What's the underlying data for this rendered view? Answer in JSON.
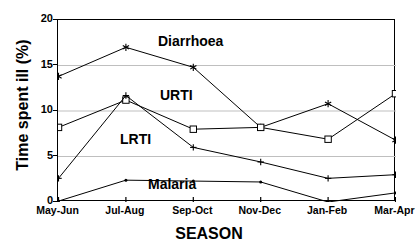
{
  "chart_data": {
    "type": "line",
    "title": "",
    "xlabel": "SEASON",
    "ylabel": "Time spent ill (%)",
    "categories": [
      "May-Jun",
      "Jul-Aug",
      "Sep-Oct",
      "Nov-Dec",
      "Jan-Feb",
      "Mar-Apr"
    ],
    "ylim": [
      0,
      20
    ],
    "yticks": [
      0,
      5,
      10,
      15,
      20
    ],
    "grid": "horizontal",
    "legend_position": "inline-annotations",
    "series": [
      {
        "name": "Diarrhoea",
        "marker": "star",
        "color": "#000000",
        "values": [
          13.8,
          17.0,
          14.8,
          8.2,
          10.8,
          6.8
        ]
      },
      {
        "name": "URTI",
        "marker": "open-square",
        "color": "#000000",
        "values": [
          8.2,
          11.2,
          8.0,
          8.2,
          6.9,
          11.9
        ]
      },
      {
        "name": "LRTI",
        "marker": "plus",
        "color": "#000000",
        "values": [
          2.6,
          11.7,
          6.0,
          4.4,
          2.6,
          3.0
        ]
      },
      {
        "name": "Malaria",
        "marker": "dot",
        "color": "#000000",
        "values": [
          0.1,
          2.4,
          2.3,
          2.2,
          0.0,
          1.0
        ]
      }
    ],
    "annotations": [
      {
        "text": "Diarrhoea",
        "series": "Diarrhoea"
      },
      {
        "text": "URTI",
        "series": "URTI"
      },
      {
        "text": "LRTI",
        "series": "LRTI"
      },
      {
        "text": "Malaria",
        "series": "Malaria"
      }
    ]
  },
  "axis": {
    "ytick_labels": [
      "0",
      "5",
      "10",
      "15",
      "20"
    ],
    "xtick_labels": [
      "May-Jun",
      "Jul-Aug",
      "Sep-Oct",
      "Nov-Dec",
      "Jan-Feb",
      "Mar-Apr"
    ],
    "ylabel": "Time spent ill (%)",
    "xlabel": "SEASON"
  }
}
